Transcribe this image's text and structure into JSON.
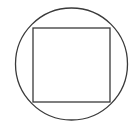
{
  "diagram": {
    "stroke_color": "#3a3a3a",
    "background": "#ffffff",
    "circle": {
      "cx": 71.5,
      "cy": 64,
      "r": 56
    },
    "square": {
      "x": 33,
      "y": 28,
      "width": 77,
      "height": 74
    }
  }
}
